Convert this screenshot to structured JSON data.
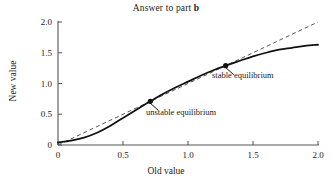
{
  "figure": {
    "title_prefix": "Answer to part ",
    "title_bold": "b",
    "background": "#ffffff",
    "ink_color": "#1a1a1a"
  },
  "chart_data": {
    "type": "line",
    "title": "Answer to part b",
    "xlabel": "Old value",
    "ylabel": "New value",
    "xlim": [
      0,
      2
    ],
    "ylim": [
      0,
      2
    ],
    "xticks": [
      "0",
      "0.5",
      "1.0",
      "1.5",
      "2.0"
    ],
    "xtick_values": [
      0,
      0.5,
      1.0,
      1.5,
      2.0
    ],
    "yticks": [
      "0",
      "0.5",
      "1.0",
      "1.5",
      "2.0"
    ],
    "ytick_values": [
      0,
      0.5,
      1.0,
      1.5,
      2.0
    ],
    "grid": false,
    "legend": null,
    "series": [
      {
        "name": "update map",
        "style": "solid",
        "color": "#111111",
        "width": 1.8,
        "x": [
          0.0,
          0.1,
          0.2,
          0.3,
          0.4,
          0.5,
          0.6,
          0.7,
          0.71,
          0.8,
          0.9,
          1.0,
          1.1,
          1.2,
          1.29,
          1.3,
          1.4,
          1.5,
          1.6,
          1.7,
          1.8,
          1.9,
          2.0
        ],
        "y": [
          0.04,
          0.07,
          0.12,
          0.2,
          0.31,
          0.44,
          0.57,
          0.7,
          0.71,
          0.82,
          0.93,
          1.03,
          1.13,
          1.22,
          1.29,
          1.3,
          1.37,
          1.44,
          1.5,
          1.55,
          1.58,
          1.61,
          1.63
        ]
      },
      {
        "name": "identity line",
        "style": "dashed",
        "color": "#555555",
        "width": 1.0,
        "x": [
          0,
          2
        ],
        "y": [
          0,
          2
        ]
      }
    ],
    "annotations": [
      {
        "id": "unstable",
        "label": "unstable equilibrium",
        "point_x": 0.71,
        "point_y": 0.71,
        "marker": "filled-circle"
      },
      {
        "id": "stable",
        "label": "stable equilibrium",
        "point_x": 1.29,
        "point_y": 1.29,
        "marker": "filled-circle"
      }
    ]
  }
}
